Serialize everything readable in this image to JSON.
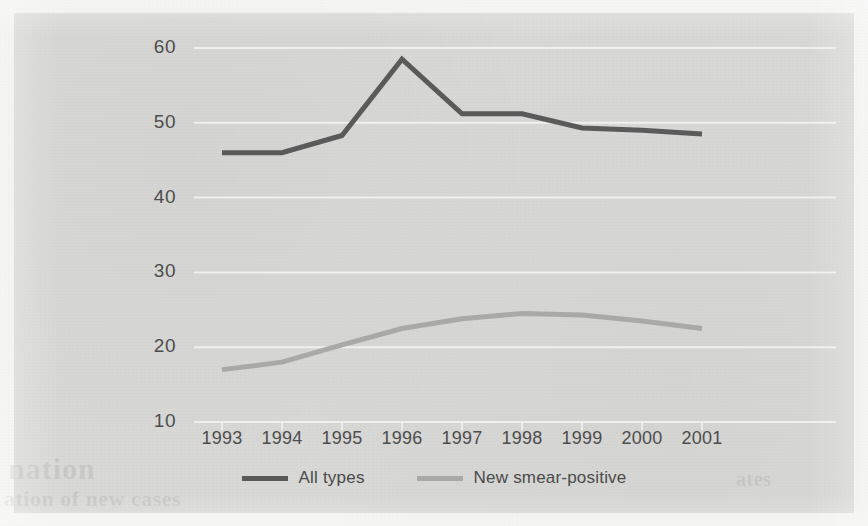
{
  "figure": {
    "background_color": "#d8d8d6",
    "page_color": "#f3f3f1"
  },
  "bleed_through": {
    "line1": "nation",
    "line2": "ation of new cases",
    "line3": "ates"
  },
  "chart_data": {
    "type": "line",
    "title": "",
    "subtitle": "",
    "xlabel": "",
    "ylabel": "",
    "x": [
      1993,
      1994,
      1995,
      1996,
      1997,
      1998,
      1999,
      2000,
      2001
    ],
    "categories": [
      "1993",
      "1994",
      "1995",
      "1996",
      "1997",
      "1998",
      "1999",
      "2000",
      "2001"
    ],
    "series": [
      {
        "name": "All types",
        "color": "#5a5a5a",
        "line_width": 5,
        "values": [
          46.0,
          46.0,
          48.3,
          58.5,
          51.2,
          51.2,
          49.3,
          49.0,
          48.5
        ]
      },
      {
        "name": "New smear-positive",
        "color": "#a9a9a7",
        "line_width": 5,
        "values": [
          17.0,
          18.0,
          20.3,
          22.5,
          23.8,
          24.5,
          24.3,
          23.5,
          22.5
        ]
      }
    ],
    "ylim": [
      10,
      60
    ],
    "yticks": [
      10,
      20,
      30,
      40,
      50,
      60
    ],
    "ytick_labels": [
      "10",
      "20",
      "30",
      "40",
      "50",
      "60"
    ],
    "xlim": [
      1993,
      2001
    ],
    "grid": true,
    "grid_color": "#f0f0ee",
    "grid_axis": "y",
    "legend_position": "bottom-center",
    "legend": [
      "All types",
      "New smear-positive"
    ]
  }
}
